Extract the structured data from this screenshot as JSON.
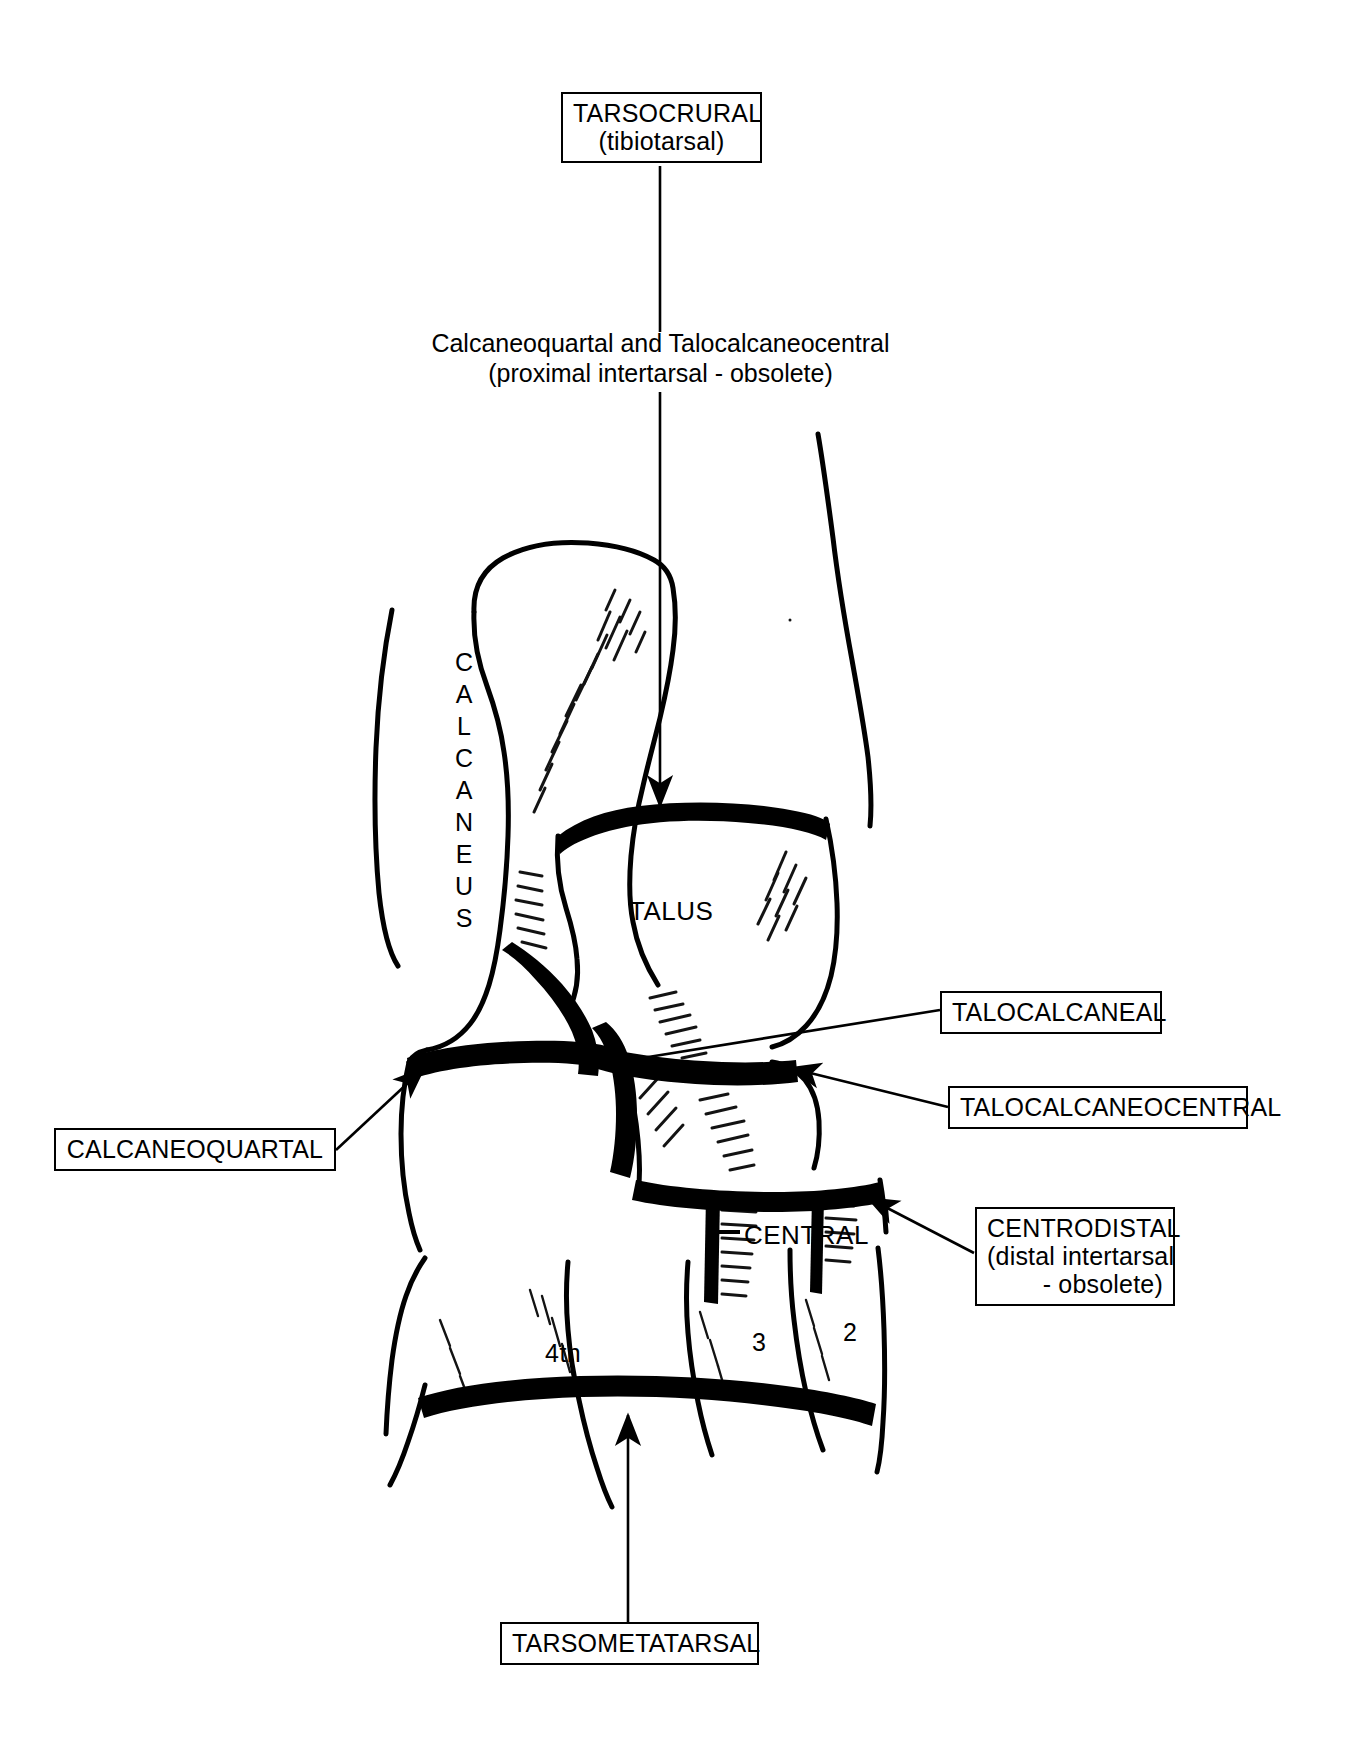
{
  "figure": {
    "background_color": "#ffffff",
    "ink_color": "#000000"
  },
  "callouts": [
    {
      "id": "tarsocrural",
      "line1": "TARSOCRURAL",
      "line2": "(tibiotarsal)",
      "boxed": true
    },
    {
      "id": "talocalcaneal",
      "line1": "TALOCALCANEAL",
      "line2": "",
      "boxed": true
    },
    {
      "id": "talocalcaneocentral",
      "line1": "TALOCALCANEOCENTRAL",
      "line2": "",
      "boxed": true
    },
    {
      "id": "centrodistal",
      "line1": "CENTRODISTAL",
      "line2": "(distal intertarsal",
      "line3": "- obsolete)",
      "boxed": true
    },
    {
      "id": "calcaneoquartal",
      "line1": "CALCANEOQUARTAL",
      "line2": "",
      "boxed": true
    },
    {
      "id": "tarsometatarsal",
      "line1": "TARSOMETATARSAL",
      "line2": "",
      "boxed": true
    }
  ],
  "plain_labels": [
    {
      "id": "proximal-intertarsal",
      "line1": "Calcaneoquartal and Talocalcaneocentral",
      "line2": "(proximal intertarsal - obsolete)"
    }
  ],
  "bone_labels": {
    "calcaneus": "CALCANEUS",
    "calcaneus_letters": [
      "C",
      "A",
      "L",
      "C",
      "A",
      "N",
      "E",
      "U",
      "S"
    ],
    "talus": "TALUS",
    "central": "CENTRAL",
    "fourth_tarsal": "4th",
    "third_tarsal": "3",
    "second_tarsal": "2"
  },
  "leader_lines": [
    {
      "id": "tarsocrural-arrow",
      "from": "tarsocrural-box",
      "to": "talus-proximal-surface",
      "style": "arrow"
    },
    {
      "id": "talocalcaneal-leader",
      "from": "talocalcaneal-box",
      "to": "talocalcaneal-joint",
      "style": "plain"
    },
    {
      "id": "talocalcaneocentral-arrow",
      "from": "talocalcaneocentral-box",
      "to": "talocalcaneocentral-joint",
      "style": "arrow"
    },
    {
      "id": "centrodistal-arrow",
      "from": "centrodistal-box",
      "to": "centrodistal-joint",
      "style": "arrow"
    },
    {
      "id": "calcaneoquartal-arrow",
      "from": "calcaneoquartal-box",
      "to": "calcaneoquartal-joint",
      "style": "arrow"
    },
    {
      "id": "tarsometatarsal-arrow",
      "from": "tarsometatarsal-box",
      "to": "tarsometatarsal-joint",
      "style": "arrow"
    },
    {
      "id": "central-leader",
      "from": "central-label",
      "to": "central-bone",
      "style": "dash"
    }
  ]
}
